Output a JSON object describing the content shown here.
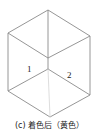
{
  "figure": {
    "caption": "(c) 着色后（黄色）",
    "face_labels": [
      "1",
      "2"
    ],
    "colors": {
      "edge": "#8a8a8a",
      "faint_edge": "#d4d4d4",
      "text": "#222222",
      "background": "#ffffff"
    },
    "vertices": {
      "top": [
        48,
        10
      ],
      "upper_left": [
        8,
        33
      ],
      "upper_right": [
        90,
        36
      ],
      "top_face_bottom": [
        48,
        58
      ],
      "center": [
        48,
        69
      ],
      "lower_left": [
        8,
        91
      ],
      "lower_right": [
        90,
        95
      ],
      "bottom": [
        50,
        117
      ]
    }
  }
}
